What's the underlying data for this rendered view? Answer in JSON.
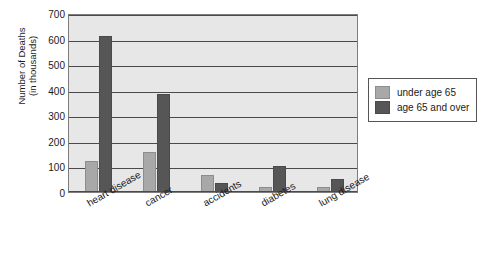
{
  "chart_data": {
    "type": "bar",
    "title": "",
    "xlabel": "",
    "ylabel": "Number of Deaths (in thousands)",
    "ylabel_lines": [
      "Number of Deaths",
      "(in thousands)"
    ],
    "categories": [
      "heart disease",
      "cancer",
      "accidents",
      "diabetes",
      "lung disease"
    ],
    "series": [
      {
        "name": "under age 65",
        "color": "#a8a8a8",
        "values": [
          120,
          155,
          65,
          18,
          18
        ]
      },
      {
        "name": "age 65 and over",
        "color": "#565656",
        "values": [
          610,
          385,
          35,
          100,
          50
        ]
      }
    ],
    "ylim": [
      0,
      700
    ],
    "ytick_step": 100,
    "yticks": [
      "0",
      "100",
      "200",
      "300",
      "400",
      "500",
      "600",
      "700"
    ],
    "grid": true,
    "legend_position": "right",
    "plot_background": "#e7e7e7",
    "grid_color": "#4a4a4a"
  }
}
